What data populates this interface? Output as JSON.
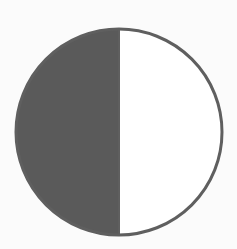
{
  "figure": {
    "type": "half-shaded-circle",
    "circle": {
      "cx": 119,
      "cy": 132,
      "r": 103
    },
    "colors": {
      "background": "#fbfbfb",
      "shaded_fill": "#5a5a5a",
      "unshaded_fill": "#ffffff",
      "outline": "#5f5f5f"
    },
    "shaded_side": "left",
    "fraction_shaded": "1/2"
  }
}
